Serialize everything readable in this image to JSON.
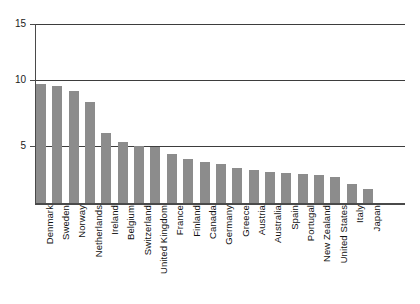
{
  "chart_data": {
    "type": "bar",
    "title": "",
    "xlabel": "",
    "ylabel": "",
    "ylim": [
      0,
      15
    ],
    "yticks": [
      5,
      10,
      15
    ],
    "ytick_labels": [
      "5",
      "10",
      "15"
    ],
    "grid": true,
    "legend": "none",
    "orientation": "vertical",
    "bar_color": "#8c8c8c",
    "categories": [
      "Denmark",
      "Sweden",
      "Norway",
      "Netherlands",
      "Ireland",
      "Belgium",
      "Switzerland",
      "United Kingdom",
      "France",
      "Finland",
      "Canada",
      "Germany",
      "Greece",
      "Austria",
      "Australia",
      "Spain",
      "Portugal",
      "New Zealand",
      "United States",
      "Italy",
      "Japan"
    ],
    "values": [
      10.0,
      9.8,
      9.4,
      8.5,
      5.9,
      5.1,
      4.8,
      4.7,
      4.1,
      3.7,
      3.4,
      3.3,
      2.9,
      2.75,
      2.6,
      2.55,
      2.4,
      2.35,
      2.2,
      1.6,
      1.15
    ]
  },
  "axes": {
    "y_axis_name": "y-axis",
    "x_axis_name": "x-axis"
  }
}
